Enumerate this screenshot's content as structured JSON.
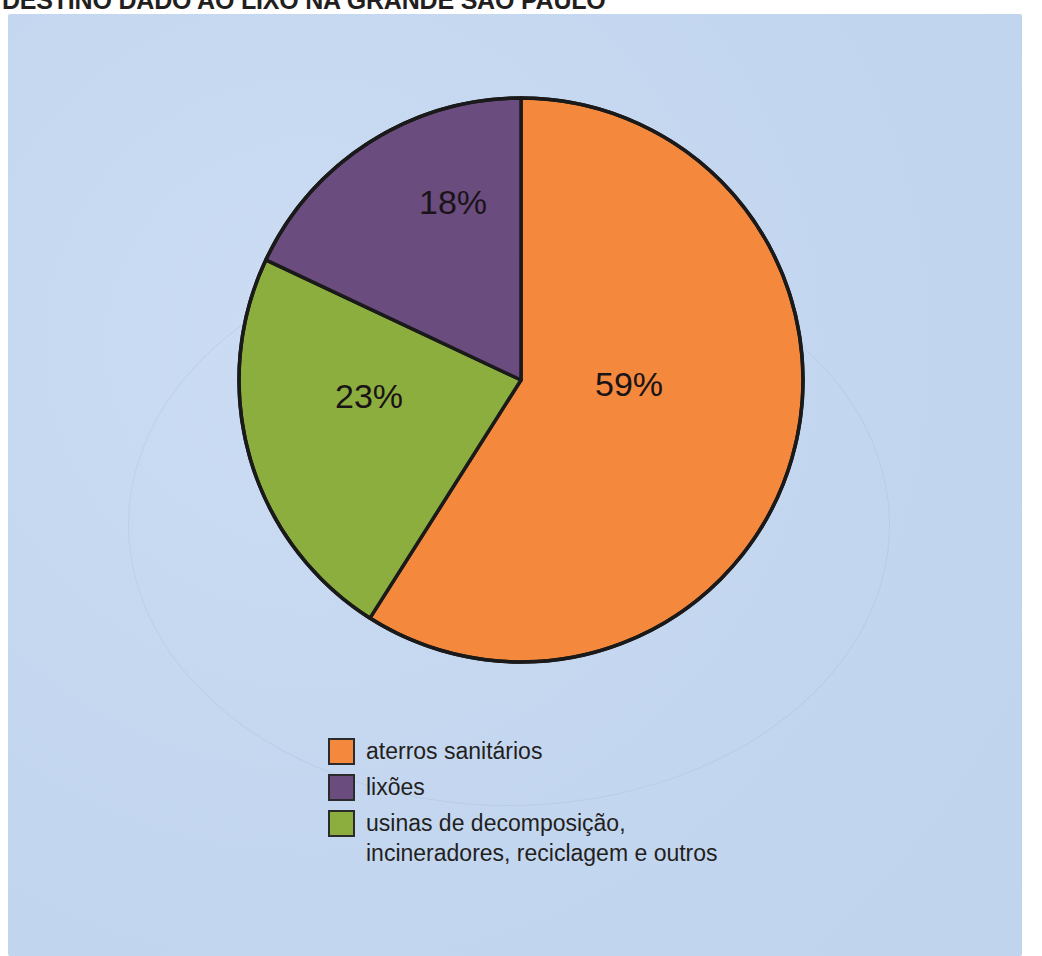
{
  "chart_title": "DESTINO DADO AO LIXO NA GRANDE SÃO PAULO",
  "colors": {
    "panel_background": "#c6d9f1",
    "page_background": "#ffffff",
    "outline": "#1a1a1a",
    "label_text": "#1a1418",
    "title_text": "#231f20"
  },
  "legend": {
    "items": [
      {
        "label": "aterros sanitários",
        "color": "#f4883c"
      },
      {
        "label": "lixões",
        "color": "#6b4c7e"
      },
      {
        "label": "usinas de decomposição,\nincineradores, reciclagem e outros",
        "color": "#8cae3e"
      }
    ]
  },
  "slice_labels": {
    "aterros": "59%",
    "usinas": "23%",
    "lixoes": "18%"
  },
  "chart_data": {
    "type": "pie",
    "title": "DESTINO DADO AO LIXO NA GRANDE SÃO PAULO",
    "unit": "%",
    "start_angle_deg": 0,
    "direction": "clockwise",
    "legend_position": "bottom",
    "categories": [
      "aterros sanitários",
      "usinas de decomposição, incineradores, reciclagem e outros",
      "lixões"
    ],
    "values": [
      59,
      23,
      18
    ],
    "labels": [
      "59%",
      "23%",
      "18%"
    ],
    "colors": [
      "#f4883c",
      "#8cae3e",
      "#6b4c7e"
    ],
    "total": 100
  }
}
